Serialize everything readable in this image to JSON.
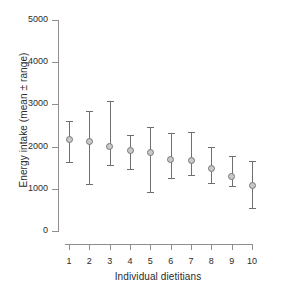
{
  "chart_data": {
    "type": "scatter",
    "title": "",
    "subtitle": "",
    "xlabel": "Individual dietitians",
    "ylabel": "Energy intake (mean ± range)",
    "categories": [
      "1",
      "2",
      "3",
      "4",
      "5",
      "6",
      "7",
      "8",
      "9",
      "10"
    ],
    "x": [
      1,
      2,
      3,
      4,
      5,
      6,
      7,
      8,
      9,
      10
    ],
    "values": [
      2180,
      2110,
      2000,
      1900,
      1860,
      1700,
      1660,
      1470,
      1290,
      1080
    ],
    "error_low": [
      1640,
      1120,
      1560,
      1460,
      920,
      1250,
      1320,
      1130,
      1070,
      540
    ],
    "error_high": [
      2600,
      2850,
      3070,
      2280,
      2460,
      2330,
      2340,
      1980,
      1780,
      1660
    ],
    "series": [
      {
        "name": "Energy intake",
        "values": [
          2180,
          2110,
          2000,
          1900,
          1860,
          1700,
          1660,
          1470,
          1290,
          1080
        ]
      }
    ],
    "ylim": [
      0,
      5000
    ],
    "xlim": [
      0.5,
      10.5
    ],
    "yticks": [
      0,
      1000,
      2000,
      3000,
      4000,
      5000
    ],
    "ytick_labels": [
      "0",
      "1000",
      "2000",
      "3000",
      "4000",
      "5000"
    ],
    "xticks": [
      1,
      2,
      3,
      4,
      5,
      6,
      7,
      8,
      9,
      10
    ],
    "xtick_labels": [
      "1",
      "2",
      "3",
      "4",
      "5",
      "6",
      "7",
      "8",
      "9",
      "10"
    ],
    "grid": false,
    "legend": false,
    "legend_position": "none",
    "marker_color": "#c9c9c9",
    "marker_edge_color": "#777777",
    "errorbar_color": "#6f6f6f",
    "axis_color": "#8e8e8e",
    "text_color": "#2b2b2b",
    "background_color": "#ffffff"
  }
}
